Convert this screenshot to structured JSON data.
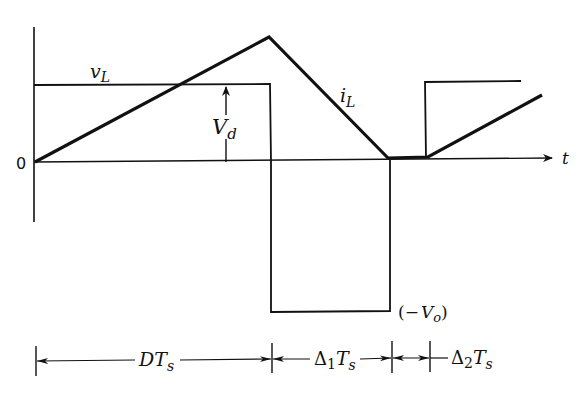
{
  "diagram": {
    "type": "waveform",
    "origin_label": "0",
    "time_axis_label": "t",
    "signals": {
      "v_L": {
        "label_main": "v",
        "label_sub": "L"
      },
      "i_L": {
        "label_main": "i",
        "label_sub": "L"
      }
    },
    "levels": {
      "positive": {
        "label_main": "V",
        "label_sub": "d"
      },
      "negative": {
        "label_prefix": "(−",
        "label_main": "V",
        "label_sub": "o",
        "label_suffix": ")"
      }
    },
    "intervals": [
      {
        "label_main": "DT",
        "label_sub": "s"
      },
      {
        "label_delta": "Δ",
        "label_idx": "1",
        "label_main": "T",
        "label_sub": "s"
      },
      {
        "label_delta": "Δ",
        "label_idx": "2",
        "label_main": "T",
        "label_sub": "s"
      }
    ],
    "stroke_color": "#111111",
    "background_color": "#ffffff"
  }
}
